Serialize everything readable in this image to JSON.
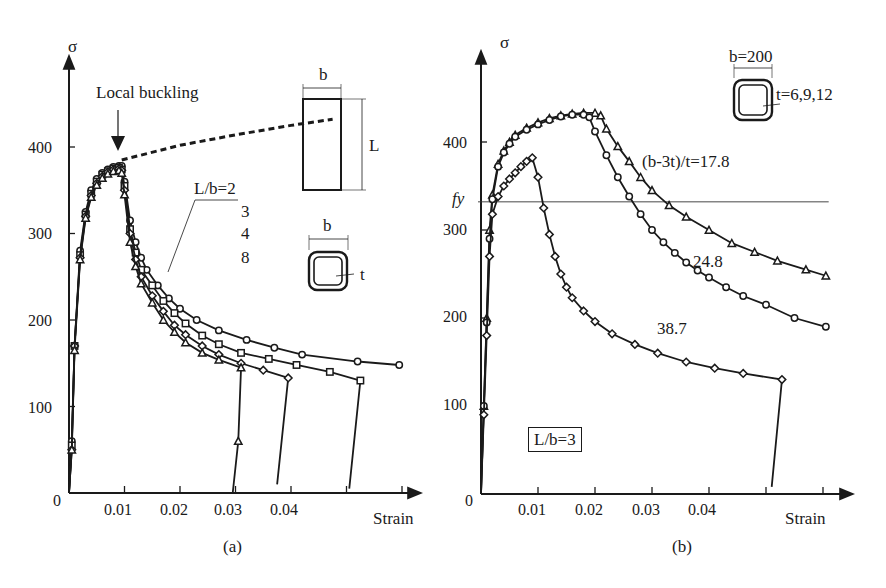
{
  "chart_data": [
    {
      "id": "a",
      "type": "line",
      "caption": "(a)",
      "xlabel": "Strain",
      "ylabel": "σ",
      "xlim": [
        0,
        0.065
      ],
      "ylim": [
        0,
        470
      ],
      "xticks": [
        0.01,
        0.02,
        0.03,
        0.04,
        0.05,
        0.06
      ],
      "xtick_labels": [
        "0.01",
        "0.02",
        "0.03",
        "0.04"
      ],
      "yticks": [
        0,
        100,
        200,
        300,
        400
      ],
      "ytick_labels": [
        "0",
        "100",
        "200",
        "300",
        "400"
      ],
      "grid": false,
      "annotations": {
        "local_buckling": "Local buckling",
        "legend_title": "L/b=2",
        "legend_items": [
          "3",
          "4",
          "8"
        ],
        "inset_b": "b",
        "inset_L": "L",
        "inset_section_b": "b",
        "inset_section_t": "t"
      },
      "reference_curve": {
        "name": "no local buckling (dashed)",
        "x": [
          0.0095,
          0.02,
          0.03,
          0.04,
          0.0475
        ],
        "y": [
          385,
          402,
          414,
          425,
          432
        ]
      },
      "series": [
        {
          "name": "L/b=2",
          "marker": "circle",
          "x": [
            0,
            0.0005,
            0.001,
            0.002,
            0.003,
            0.004,
            0.005,
            0.006,
            0.007,
            0.008,
            0.009,
            0.0095,
            0.01,
            0.011,
            0.012,
            0.013,
            0.014,
            0.016,
            0.018,
            0.02,
            0.023,
            0.027,
            0.032,
            0.037,
            0.042,
            0.052,
            0.0595
          ],
          "y": [
            0,
            60,
            170,
            280,
            325,
            350,
            363,
            370,
            374,
            377,
            378,
            378,
            360,
            315,
            290,
            272,
            258,
            240,
            225,
            213,
            200,
            188,
            177,
            168,
            160,
            152,
            148
          ]
        },
        {
          "name": "L/b=3",
          "marker": "square",
          "x": [
            0,
            0.0005,
            0.001,
            0.002,
            0.003,
            0.004,
            0.005,
            0.006,
            0.007,
            0.008,
            0.009,
            0.0095,
            0.01,
            0.011,
            0.012,
            0.013,
            0.015,
            0.017,
            0.019,
            0.021,
            0.024,
            0.027,
            0.031,
            0.036,
            0.041,
            0.047,
            0.0525,
            0.0505
          ],
          "y": [
            0,
            55,
            170,
            275,
            322,
            346,
            360,
            368,
            372,
            375,
            376,
            374,
            355,
            305,
            278,
            258,
            240,
            222,
            208,
            196,
            182,
            172,
            162,
            155,
            148,
            140,
            130,
            5
          ]
        },
        {
          "name": "L/b=4",
          "marker": "diamond",
          "x": [
            0,
            0.0005,
            0.001,
            0.002,
            0.003,
            0.004,
            0.005,
            0.006,
            0.007,
            0.008,
            0.009,
            0.0095,
            0.01,
            0.011,
            0.012,
            0.013,
            0.015,
            0.017,
            0.019,
            0.021,
            0.024,
            0.027,
            0.031,
            0.035,
            0.0395,
            0.0375
          ],
          "y": [
            0,
            50,
            170,
            272,
            320,
            344,
            358,
            366,
            371,
            374,
            375,
            373,
            350,
            300,
            270,
            250,
            228,
            210,
            194,
            183,
            170,
            160,
            150,
            142,
            133,
            10
          ]
        },
        {
          "name": "L/b=8",
          "marker": "triangle",
          "x": [
            0,
            0.0005,
            0.001,
            0.002,
            0.003,
            0.004,
            0.005,
            0.006,
            0.007,
            0.008,
            0.009,
            0.0095,
            0.01,
            0.011,
            0.012,
            0.013,
            0.015,
            0.017,
            0.019,
            0.021,
            0.024,
            0.027,
            0.031,
            0.0305,
            0.0295
          ],
          "y": [
            0,
            50,
            165,
            270,
            318,
            342,
            356,
            364,
            369,
            372,
            373,
            370,
            345,
            290,
            262,
            242,
            220,
            200,
            186,
            174,
            162,
            154,
            145,
            60,
            0
          ]
        }
      ]
    },
    {
      "id": "b",
      "type": "line",
      "caption": "(b)",
      "xlabel": "Strain",
      "ylabel": "σ",
      "xlim": [
        0,
        0.065
      ],
      "ylim": [
        0,
        470
      ],
      "xticks": [
        0.01,
        0.02,
        0.03,
        0.04,
        0.05,
        0.06
      ],
      "xtick_labels": [
        "0.01",
        "0.02",
        "0.03",
        "0.04"
      ],
      "yticks": [
        0,
        100,
        200,
        300,
        400
      ],
      "ytick_labels": [
        "0",
        "100",
        "200",
        "300",
        "400"
      ],
      "reference_line": {
        "label": "fy",
        "y": 332
      },
      "grid": false,
      "annotations": {
        "inset_b": "b=200",
        "inset_t": "t=6,9,12",
        "boxed_label": "L/b=3",
        "label_17_8": "(b-3t)/t=17.8",
        "label_24_8": "24.8",
        "label_38_7": "38.7"
      },
      "series": [
        {
          "name": "(b-3t)/t=17.8",
          "marker": "triangle",
          "x": [
            0,
            0.0005,
            0.001,
            0.0015,
            0.002,
            0.003,
            0.004,
            0.005,
            0.006,
            0.008,
            0.01,
            0.012,
            0.014,
            0.016,
            0.018,
            0.02,
            0.021,
            0.022,
            0.024,
            0.026,
            0.028,
            0.03,
            0.033,
            0.036,
            0.04,
            0.044,
            0.048,
            0.052,
            0.057,
            0.0605
          ],
          "y": [
            0,
            100,
            200,
            300,
            340,
            375,
            390,
            400,
            408,
            416,
            422,
            427,
            430,
            432,
            433,
            433,
            430,
            415,
            395,
            378,
            360,
            345,
            328,
            315,
            300,
            285,
            275,
            265,
            255,
            248
          ]
        },
        {
          "name": "24.8",
          "marker": "circle",
          "x": [
            0,
            0.0005,
            0.001,
            0.0015,
            0.002,
            0.003,
            0.004,
            0.005,
            0.006,
            0.008,
            0.01,
            0.012,
            0.014,
            0.016,
            0.018,
            0.019,
            0.02,
            0.022,
            0.024,
            0.026,
            0.028,
            0.03,
            0.032,
            0.034,
            0.036,
            0.038,
            0.04,
            0.043,
            0.046,
            0.05,
            0.055,
            0.0605
          ],
          "y": [
            0,
            100,
            195,
            290,
            335,
            372,
            388,
            398,
            406,
            414,
            420,
            425,
            429,
            431,
            431,
            428,
            412,
            385,
            360,
            338,
            318,
            300,
            286,
            274,
            263,
            254,
            246,
            235,
            225,
            215,
            200,
            190
          ]
        },
        {
          "name": "38.7",
          "marker": "diamond",
          "x": [
            0,
            0.0005,
            0.001,
            0.0015,
            0.002,
            0.003,
            0.004,
            0.005,
            0.006,
            0.007,
            0.008,
            0.009,
            0.01,
            0.011,
            0.012,
            0.013,
            0.014,
            0.015,
            0.016,
            0.018,
            0.02,
            0.023,
            0.027,
            0.031,
            0.036,
            0.041,
            0.046,
            0.0528,
            0.051
          ],
          "y": [
            0,
            90,
            180,
            270,
            318,
            338,
            350,
            358,
            365,
            372,
            378,
            382,
            360,
            325,
            295,
            270,
            250,
            235,
            223,
            208,
            196,
            182,
            170,
            160,
            150,
            143,
            137,
            130,
            8
          ]
        }
      ]
    }
  ]
}
